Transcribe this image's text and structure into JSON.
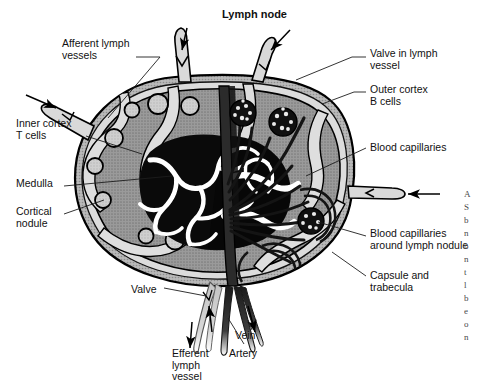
{
  "figure": {
    "title": "Lymph node",
    "type": "anatomical-diagram",
    "style": "grayscale line drawing with halftone shading"
  },
  "labels": [
    {
      "id": "afferent-lymph-vessels",
      "text": "Afferent lymph\nvessels",
      "x": 62,
      "y": 38,
      "align": "left"
    },
    {
      "id": "inner-cortex-t-cells",
      "text": "Inner cortex\nT cells",
      "x": 16,
      "y": 118,
      "align": "left"
    },
    {
      "id": "medulla",
      "text": "Medulla",
      "x": 16,
      "y": 178,
      "align": "left"
    },
    {
      "id": "cortical-nodule",
      "text": "Cortical\nnodule",
      "x": 16,
      "y": 206,
      "align": "left"
    },
    {
      "id": "valve-in-lymph-vessel",
      "text": "Valve in lymph\nvessel",
      "x": 370,
      "y": 48,
      "align": "left"
    },
    {
      "id": "outer-cortex-b-cells",
      "text": "Outer cortex\nB cells",
      "x": 370,
      "y": 84,
      "align": "left"
    },
    {
      "id": "blood-capillaries",
      "text": "Blood capillaries",
      "x": 370,
      "y": 142,
      "align": "left"
    },
    {
      "id": "blood-capillaries-around-lymph-nodule",
      "text": "Blood capillaries\naround lymph nodule",
      "x": 370,
      "y": 228,
      "align": "left"
    },
    {
      "id": "capsule-and-trabecula",
      "text": "Capsule and\ntrabecula",
      "x": 370,
      "y": 270,
      "align": "left"
    },
    {
      "id": "valve",
      "text": "Valve",
      "x": 131,
      "y": 284,
      "align": "left"
    },
    {
      "id": "efferent-lymph-vessel",
      "text": "Efferent\nlymph\nvessel",
      "x": 172,
      "y": 348,
      "align": "left"
    },
    {
      "id": "artery",
      "text": "Artery",
      "x": 229,
      "y": 348,
      "align": "left"
    },
    {
      "id": "vein",
      "text": "Vein",
      "x": 235,
      "y": 330,
      "align": "left"
    }
  ],
  "structures": [
    "capsule",
    "subcapsular sinus",
    "trabecula",
    "outer cortex",
    "cortical nodule",
    "inner cortex",
    "medulla",
    "medullary sinus",
    "hilum",
    "afferent lymph vessel",
    "efferent lymph vessel",
    "artery",
    "vein",
    "blood capillaries",
    "valve"
  ],
  "flow_arrows": [
    {
      "id": "afferent-top-left",
      "direction": "into-node"
    },
    {
      "id": "afferent-top-right",
      "direction": "into-node"
    },
    {
      "id": "afferent-left",
      "direction": "into-node"
    },
    {
      "id": "afferent-right",
      "direction": "into-node"
    },
    {
      "id": "efferent-out",
      "direction": "out-of-node"
    },
    {
      "id": "artery-in",
      "direction": "into-node"
    },
    {
      "id": "vein-out",
      "direction": "out-of-node"
    }
  ],
  "colors": {
    "background": "#ffffff",
    "ink": "#000000",
    "cortex_gray": "#939393",
    "nodule_gray": "#c6c6c6",
    "sinus_light": "#d8d8d8",
    "medulla_black": "#0a0a0a",
    "capsule_gray": "#b0b0b0",
    "vessel_dark": "#1c1c1c",
    "leader_line": "#2a2a2a"
  },
  "margin_text": [
    "A",
    "S",
    "b",
    "n",
    "b",
    "n",
    "t",
    "l",
    "b",
    "e",
    "o",
    "n"
  ]
}
